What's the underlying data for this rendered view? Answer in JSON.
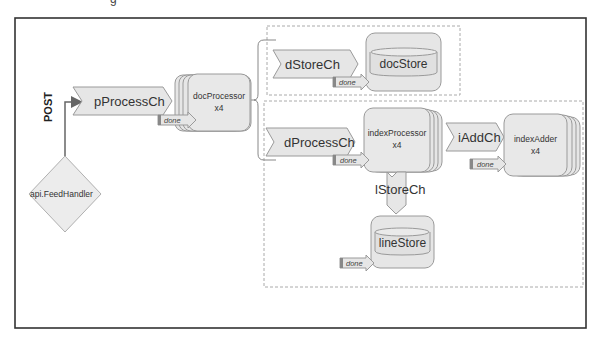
{
  "header": {
    "cut_text": "g"
  },
  "diagram": {
    "entry": {
      "label": "api.FeedHandler",
      "method": "POST"
    },
    "channels": {
      "pProcessCh": "pProcessCh",
      "dStoreCh": "dStoreCh",
      "dProcessCh": "dProcessCh",
      "iAddCh": "iAddCh",
      "lStoreCh": "lStoreCh"
    },
    "processors": {
      "docProcessor": {
        "name": "docProcessor",
        "count": "x4"
      },
      "indexProcessor": {
        "name": "indexProcessor",
        "count": "x4"
      },
      "indexAdder": {
        "name": "indexAdder",
        "count": "x4"
      }
    },
    "stores": {
      "docStore": "docStore",
      "lineStore": "lineStore"
    },
    "done_label": "done",
    "colors": {
      "frame": "#333333",
      "shape_fill": "#e6e6e6",
      "shape_stroke": "#9a9a9a",
      "dashed": "#aaaaaa",
      "connector": "#666666"
    }
  }
}
